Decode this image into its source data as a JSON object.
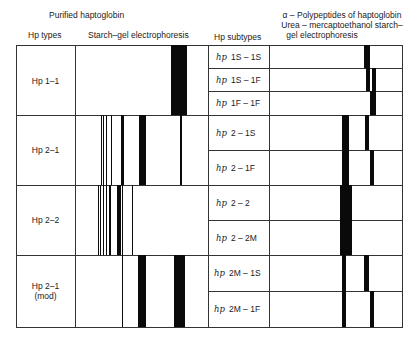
{
  "header": {
    "left_title": "Purified haptoglobin",
    "right_title_line1": "α – Polypeptides of haptoglobin",
    "right_title_line2": "Urea – mercaptoethanol starch–",
    "right_title_line3": "gel electrophoresis",
    "col_hp_types": "Hp types",
    "col_starch_gel": "Starch–gel electrophoresis",
    "col_hp_subtypes": "Hp subtypes"
  },
  "rows": [
    {
      "type_line1": "Hp 1–1",
      "type_line2": "",
      "subtypes": [
        {
          "prefix": "hp",
          "label": "1S – 1S"
        },
        {
          "prefix": "hp",
          "label": "1S – 1F"
        },
        {
          "prefix": "hp",
          "label": "1F – 1F"
        }
      ]
    },
    {
      "type_line1": "Hp 2–1",
      "type_line2": "",
      "subtypes": [
        {
          "prefix": "hp",
          "label": "2 – 1S"
        },
        {
          "prefix": "hp",
          "label": "2 – 1F"
        }
      ]
    },
    {
      "type_line1": "Hp 2–2",
      "type_line2": "",
      "subtypes": [
        {
          "prefix": "hp",
          "label": "2 – 2"
        },
        {
          "prefix": "hp",
          "label": "2 – 2M"
        }
      ]
    },
    {
      "type_line1": "Hp 2–1",
      "type_line2": "(mod)",
      "subtypes": [
        {
          "prefix": "hp",
          "label": "2M – 1S"
        },
        {
          "prefix": "hp",
          "label": "2M – 1F"
        }
      ]
    }
  ],
  "colors": {
    "band": "#0a0a0a",
    "grid": "#333333",
    "background": "#ffffff"
  }
}
